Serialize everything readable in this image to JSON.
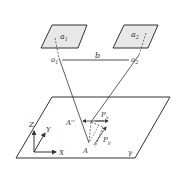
{
  "diagram": {
    "type": "stereo-camera-geometry",
    "camera_1": {
      "image_plane_label": "a",
      "image_plane_sub": "1",
      "center_label": "o",
      "center_sub": "1"
    },
    "camera_2": {
      "image_plane_label": "a",
      "image_plane_sub": "2",
      "center_label": "o",
      "center_sub": "2"
    },
    "baseline_label": "b",
    "ground_plane_label": "γ",
    "point_labels": {
      "A": "A",
      "A_double_prime": "A''"
    },
    "vector_labels": {
      "px": "P",
      "px_sub": "x",
      "py": "P",
      "py_sub": "y"
    },
    "axes": {
      "x": "X",
      "y": "Y",
      "z": "Z"
    },
    "colors": {
      "stroke": "#333333",
      "plane_fill": "#e8e8e8",
      "background": "#ffffff"
    }
  }
}
